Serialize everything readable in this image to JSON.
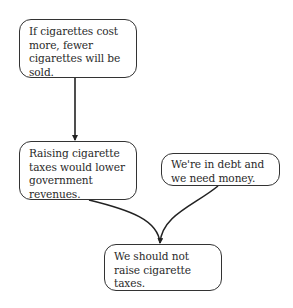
{
  "diagram": {
    "type": "argument-map",
    "nodes": [
      {
        "id": "n1",
        "text": "If cigarettes cost more, fewer cigarettes will be sold."
      },
      {
        "id": "n2",
        "text": "Raising cigarette taxes would lower government revenues."
      },
      {
        "id": "n3",
        "text": "We're in debt and we need money."
      },
      {
        "id": "n4",
        "text": "We should not raise cigarette taxes."
      }
    ],
    "edges": [
      {
        "from": "n1",
        "to": "n2"
      },
      {
        "from": "n2",
        "to": "n4"
      },
      {
        "from": "n3",
        "to": "n4"
      }
    ]
  },
  "colors": {
    "stroke": "#333333",
    "background": "#ffffff",
    "text": "#2a2a2a"
  }
}
